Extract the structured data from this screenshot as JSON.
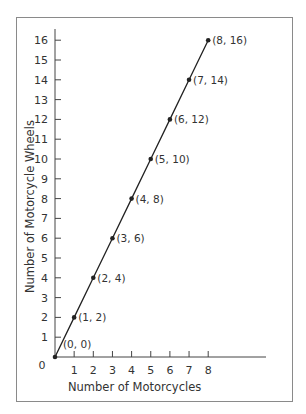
{
  "chart_data": {
    "type": "line",
    "title": "",
    "xlabel": "Number of Motorcycles",
    "ylabel": "Number of Motorcycle Wheels",
    "x": [
      0,
      1,
      2,
      3,
      4,
      5,
      6,
      7,
      8
    ],
    "series": [
      {
        "name": "Wheels",
        "values": [
          0,
          2,
          4,
          6,
          8,
          10,
          12,
          14,
          16
        ]
      }
    ],
    "point_labels": [
      "(0, 0)",
      "(1, 2)",
      "(2, 4)",
      "(3, 6)",
      "(4, 8)",
      "(5, 10)",
      "(6, 12)",
      "(7, 14)",
      "(8, 16)"
    ],
    "xticks": [
      "1",
      "2",
      "3",
      "4",
      "5",
      "6",
      "7",
      "8"
    ],
    "yticks": [
      "1",
      "2",
      "3",
      "4",
      "5",
      "6",
      "7",
      "8",
      "9",
      "10",
      "11",
      "12",
      "13",
      "14",
      "15",
      "16"
    ],
    "origin_label": "0",
    "xlim": [
      0,
      8
    ],
    "ylim": [
      0,
      16
    ],
    "grid": false,
    "legend": "none"
  },
  "colors": {
    "line": "#222222",
    "frame": "#8a8a8a",
    "text": "#333333"
  }
}
